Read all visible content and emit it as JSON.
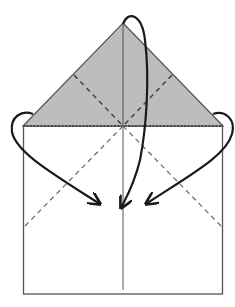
{
  "diagram": {
    "type": "origami-fold-step",
    "colors": {
      "background": "#ffffff",
      "paper": "#ffffff",
      "shaded_flap": "#bdbdbd",
      "outline": "#555555",
      "arrow": "#1a1a1a",
      "dashed": "#555555"
    },
    "elements": {
      "flap_label": "Top triangular flap (colored side)",
      "square_label": "Paper square",
      "center_crease_label": "Center crease",
      "valley_folds_label": "Valley fold lines",
      "arrow_top_label": "Fold top point down",
      "arrow_left_label": "Fold left corner in",
      "arrow_right_label": "Fold right corner in"
    }
  }
}
